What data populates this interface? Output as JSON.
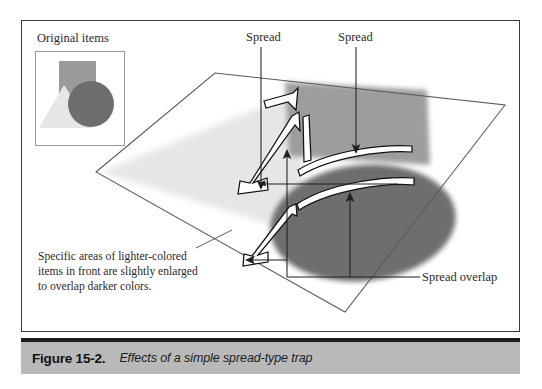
{
  "figure": {
    "caption_number": "Figure 15-2.",
    "caption_text": "Effects of a simple spread-type trap"
  },
  "inset": {
    "title": "Original items",
    "shapes": [
      {
        "name": "rectangle",
        "color": "#9a9a9a"
      },
      {
        "name": "triangle",
        "color": "#e2e2e2"
      },
      {
        "name": "circle",
        "color": "#6e6e6e"
      }
    ]
  },
  "note": {
    "text": "Specific areas of lighter-colored items in front are slightly enlarged to overlap darker colors."
  },
  "labels": {
    "spread_left": "Spread",
    "spread_right": "Spread",
    "spread_overlap": "Spread overlap"
  },
  "colors": {
    "plane_outline": "#4a4a4a",
    "rectangle_gray": "#9a9a9a",
    "triangle_light": "#e8e8e8",
    "ellipse_dark": "#6e6e6e",
    "caption_bar": "#b9b9b9",
    "caption_rule": "#1b1b1b",
    "frame_border": "#3a3a3a",
    "arrow": "#1f1f1f",
    "spread_outline_stroke": "#111111",
    "spread_outline_fill": "#ffffff"
  },
  "diagram": {
    "type": "perspective-plane-illustration",
    "plane_vertices": "96,172 215,73 505,105 345,312",
    "elements": [
      {
        "name": "light-triangle-on-plane",
        "color": "#e8e8e8"
      },
      {
        "name": "gray-rectangle-on-plane",
        "color": "#9a9a9a"
      },
      {
        "name": "dark-ellipse-on-plane",
        "color": "#6e6e6e"
      },
      {
        "name": "spread-outline-chevron-upper",
        "color": "#ffffff"
      },
      {
        "name": "spread-outline-chevron-middle",
        "color": "#ffffff"
      },
      {
        "name": "spread-outline-chevron-lower",
        "color": "#ffffff"
      },
      {
        "name": "spread-outline-arc-upper",
        "color": "#ffffff"
      },
      {
        "name": "spread-outline-arc-lower",
        "color": "#ffffff"
      }
    ]
  }
}
